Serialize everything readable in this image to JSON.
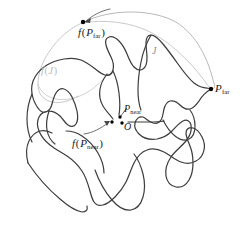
{
  "figure": {
    "caption_present": false,
    "background_color": "#ffffff",
    "curve_color": "#3a3a3a",
    "faint_curve_color": "#a8a8a8",
    "point_color": "#000000",
    "labels": {
      "f_p_far": {
        "func": "f",
        "open": "(",
        "base": "P",
        "sub": "far",
        "close": ")",
        "color": "#1c1c1c"
      },
      "p_far": {
        "base": "P",
        "sub": "far",
        "color": "#1c1c1c"
      },
      "j": {
        "text": "J",
        "color": "#8d8d8d"
      },
      "f_j": {
        "func": "f",
        "open": "(",
        "base": "J",
        "close": ")",
        "color": "#b9b9b9"
      },
      "p_near": {
        "base": "P",
        "sub": "near",
        "color": "#1c1c1c"
      },
      "origin": {
        "text": "O",
        "color": "#1c1c1c"
      },
      "f_p_near": {
        "func": "f",
        "open": "(",
        "base": "P",
        "sub": "near",
        "close": ")",
        "color": "#1c1c1c"
      }
    },
    "points": [
      {
        "name": "f-p-far-point",
        "x": 83,
        "y": 22
      },
      {
        "name": "p-far-point",
        "x": 211,
        "y": 89
      },
      {
        "name": "f-p-near-point",
        "x": 111,
        "y": 121
      },
      {
        "name": "origin-point",
        "x": 123,
        "y": 124
      },
      {
        "name": "p-near-point",
        "x": 119,
        "y": 116
      }
    ]
  }
}
